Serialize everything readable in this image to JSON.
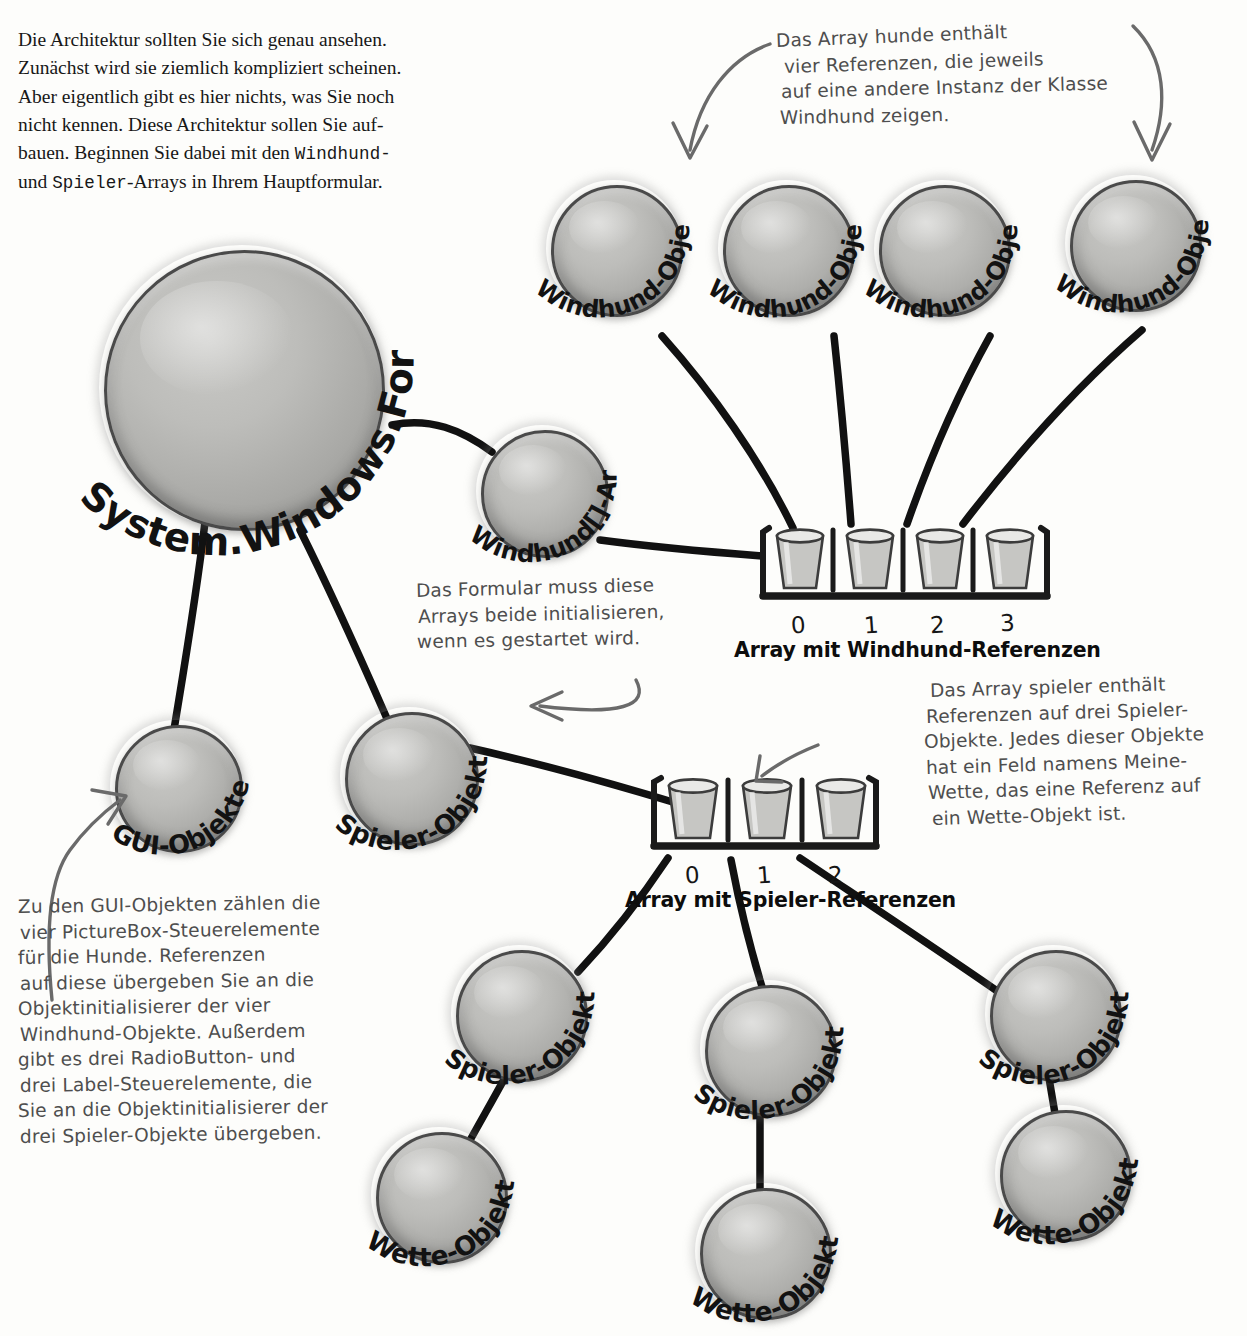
{
  "body_text": {
    "lines": [
      "Die Architektur sollten Sie sich genau ansehen.",
      "Zunächst wird sie ziemlich kompliziert scheinen.",
      "Aber eigentlich gibt es hier nichts, was Sie noch",
      "nicht kennen. Diese Architektur sollen Sie auf-"
    ],
    "line5_a": "bauen. Beginnen Sie dabei mit den ",
    "line5_mono": "Windhund-",
    "line6_mono": "Spieler",
    "line6_a": "und ",
    "line6_b": "-Arrays in Ihrem Hauptformular."
  },
  "notes": {
    "hunde_array": {
      "lines": [
        "Das Array hunde enthält",
        "vier Referenzen, die jeweils",
        "auf eine andere Instanz der Klasse",
        "Windhund zeigen."
      ]
    },
    "formular": {
      "lines": [
        "Das Formular muss diese",
        "Arrays beide initialisieren,",
        "wenn es gestartet wird."
      ]
    },
    "spieler_array": {
      "lines": [
        "Das Array spieler enthält",
        "Referenzen auf drei Spieler-",
        "Objekte. Jedes dieser Objekte",
        "hat ein Feld namens Meine-",
        "Wette, das eine Referenz auf",
        "ein Wette-Objekt ist."
      ]
    },
    "gui_objekte": {
      "lines": [
        "Zu den GUI-Objekten zählen die",
        "vier PictureBox-Steuerelemente",
        "für die Hunde. Referenzen",
        "auf diese übergeben Sie an die",
        "Objektinitialisierer der vier",
        "Windhund-Objekte. Außerdem",
        "gibt es drei RadioButton- und",
        "drei Label-Steuerelemente, die",
        "Sie an die Objektinitialisierer der",
        "drei Spieler-Objekte übergeben."
      ]
    }
  },
  "objects": {
    "form": {
      "label": "System.Windows.Form-Objekt"
    },
    "windhund_array_obj": {
      "label": "Windhund[]-Array"
    },
    "gui": {
      "label": "GUI-Objekte"
    },
    "spieler_main": {
      "label": "Spieler-Objekt"
    },
    "windhund_1": {
      "label": "Windhund-Objekt"
    },
    "windhund_2": {
      "label": "Windhund-Objekt"
    },
    "windhund_3": {
      "label": "Windhund-Objekt"
    },
    "windhund_4": {
      "label": "Windhund-Objekt"
    },
    "spieler_1": {
      "label": "Spieler-Objekt"
    },
    "spieler_2": {
      "label": "Spieler-Objekt"
    },
    "spieler_3": {
      "label": "Spieler-Objekt"
    },
    "wette_1": {
      "label": "Wette-Objekt"
    },
    "wette_2": {
      "label": "Wette-Objekt"
    },
    "wette_3": {
      "label": "Wette-Objekt"
    }
  },
  "arrays": {
    "windhund": {
      "caption": "Array mit Windhund-Referenzen",
      "indices": [
        "0",
        "1",
        "2",
        "3"
      ],
      "slot_count": 4
    },
    "spieler": {
      "caption": "Array mit Spieler-Referenzen",
      "indices": [
        "0",
        "1",
        "2"
      ],
      "slot_count": 3
    }
  },
  "colors": {
    "ball_fill": "#b5b5b2",
    "ball_outline": "#4a4a4a",
    "ink_hand": "#4e4e4e",
    "ink_print": "#171717",
    "page": "#fdfdfb"
  }
}
